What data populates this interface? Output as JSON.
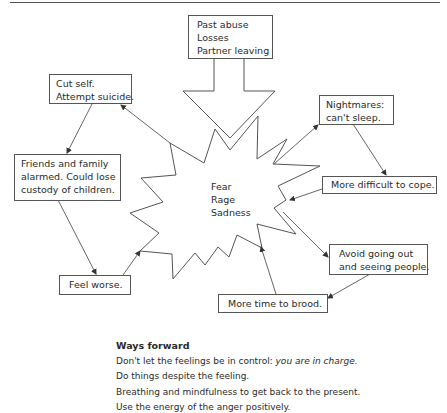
{
  "diagram": {
    "trigger_box": {
      "lines": [
        "Past abuse",
        "Losses",
        "Partner leaving"
      ]
    },
    "center": {
      "lines": [
        "Fear",
        "Rage",
        "Sadness"
      ]
    },
    "cycle_boxes": {
      "nightmares": {
        "lines": [
          "Nightmares:",
          "can't sleep."
        ]
      },
      "more_difficult": {
        "lines": [
          "More difficult to cope."
        ]
      },
      "avoid": {
        "lines": [
          "Avoid going out",
          "and seeing people."
        ]
      },
      "more_time": {
        "lines": [
          "More time to brood."
        ]
      },
      "feel_worse": {
        "lines": [
          "Feel worse."
        ]
      },
      "friends": {
        "lines": [
          "Friends and family",
          "alarmed. Could lose",
          "custody of children."
        ]
      },
      "cut_self": {
        "lines": [
          "Cut self.",
          "Attempt suicide."
        ]
      }
    },
    "line_color": "#555555"
  },
  "ways_forward": {
    "title": "Ways forward",
    "items": [
      {
        "text": "Don't let the feelings be in control: ",
        "emphasis": "you are in charge."
      },
      {
        "text": "Do things despite the feeling."
      },
      {
        "text": "Breathing and mindfulness to get back to the present."
      },
      {
        "text": "Use the energy of the anger positively."
      }
    ]
  }
}
